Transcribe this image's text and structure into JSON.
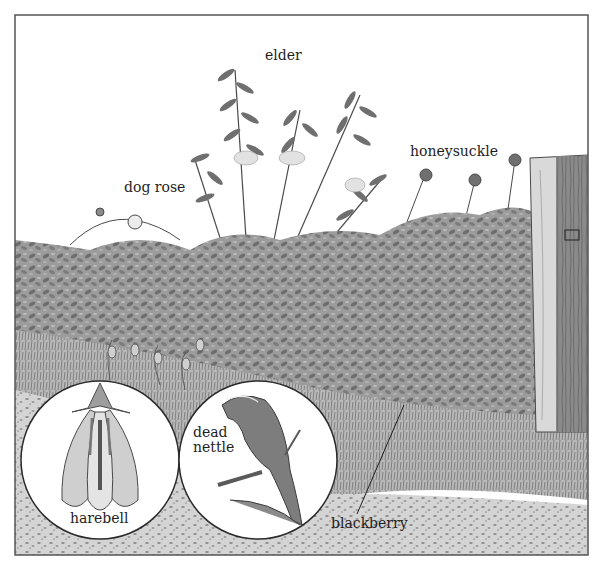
{
  "figure": {
    "colors": {
      "frame": "#555555",
      "ink": "#1e1e1e",
      "sky": "#ffffff",
      "foliage": "#8a8a8a",
      "ground": "#c9c9c9",
      "post_light": "#d9d9d9",
      "post_dark": "#7a7a7a"
    }
  },
  "labels": {
    "elder": "elder",
    "dog_rose": "dog rose",
    "honeysuckle": "honeysuckle",
    "harebell": "harebell",
    "dead_nettle": "dead\nnettle",
    "blackberry": "blackberry"
  },
  "insets": [
    {
      "name": "harebell-inset",
      "subject": "harebell flower cross-section"
    },
    {
      "name": "dead-nettle-inset",
      "subject": "dead nettle flower"
    }
  ]
}
